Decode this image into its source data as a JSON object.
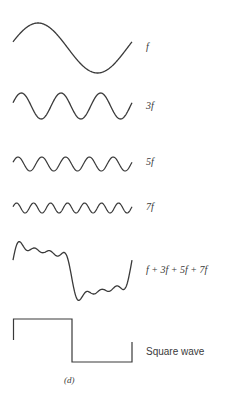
{
  "figure": {
    "caption": "(d)",
    "stroke_color": "#3a3a3a",
    "waves": [
      {
        "id": "f",
        "label": "f",
        "harmonic": 1,
        "center_y": 48,
        "amplitude": 25
      },
      {
        "id": "3f",
        "label": "3f",
        "harmonic": 3,
        "center_y": 106,
        "amplitude": 13
      },
      {
        "id": "5f",
        "label": "5f",
        "harmonic": 5,
        "center_y": 164,
        "amplitude": 7
      },
      {
        "id": "7f",
        "label": "7f",
        "harmonic": 7,
        "center_y": 208,
        "amplitude": 5
      },
      {
        "id": "sum",
        "label": "f + 3f + 5f + 7f",
        "harmonic": "sum",
        "center_y": 271,
        "amplitude": 26
      },
      {
        "id": "square",
        "label": "Square wave",
        "harmonic": "square",
        "center_y": 341,
        "amplitude": 22
      }
    ]
  }
}
